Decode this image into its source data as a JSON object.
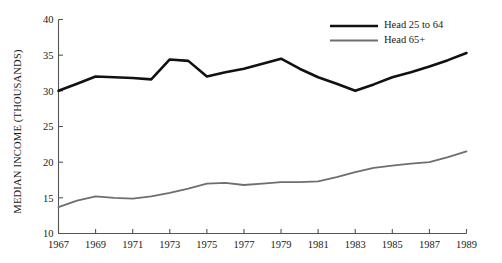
{
  "chart_data": {
    "type": "line",
    "title": "",
    "xlabel": "",
    "ylabel": "MEDIAN INCOME (THOUSANDS)",
    "xlim": [
      1967,
      1989
    ],
    "ylim": [
      10,
      40
    ],
    "grid": false,
    "legend_position": "top-right",
    "x": [
      1967,
      1968,
      1969,
      1970,
      1971,
      1972,
      1973,
      1974,
      1975,
      1976,
      1977,
      1978,
      1979,
      1980,
      1981,
      1982,
      1983,
      1984,
      1985,
      1986,
      1987,
      1988,
      1989
    ],
    "xticks": [
      "1967",
      "1969",
      "1971",
      "1973",
      "1975",
      "1977",
      "1979",
      "1981",
      "1983",
      "1985",
      "1987",
      "1989"
    ],
    "xtick_values": [
      1967,
      1969,
      1971,
      1973,
      1975,
      1977,
      1979,
      1981,
      1983,
      1985,
      1987,
      1989
    ],
    "yticks": [
      "10",
      "15",
      "20",
      "25",
      "30",
      "35",
      "40"
    ],
    "ytick_values": [
      10,
      15,
      20,
      25,
      30,
      35,
      40
    ],
    "series": [
      {
        "name": "Head 25 to 64",
        "color": "#111111",
        "width": 2.6,
        "values": [
          30.0,
          31.0,
          32.0,
          31.9,
          31.8,
          31.6,
          34.4,
          34.2,
          32.0,
          32.6,
          33.1,
          33.8,
          34.5,
          33.1,
          31.9,
          31.0,
          30.0,
          30.9,
          31.9,
          32.6,
          33.4,
          34.3,
          35.3
        ]
      },
      {
        "name": "Head 65+",
        "color": "#6e6e6e",
        "width": 1.8,
        "values": [
          13.7,
          14.6,
          15.2,
          15.0,
          14.9,
          15.2,
          15.7,
          16.3,
          17.0,
          17.1,
          16.8,
          17.0,
          17.2,
          17.2,
          17.3,
          17.9,
          18.6,
          19.2,
          19.5,
          19.8,
          20.0,
          20.7,
          21.5
        ]
      }
    ]
  },
  "legend": {
    "items": [
      {
        "label": "Head 25 to 64"
      },
      {
        "label": "Head 65+"
      }
    ]
  }
}
